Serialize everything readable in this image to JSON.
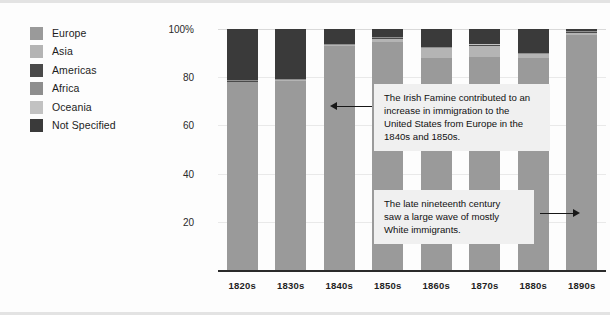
{
  "legend": {
    "items": [
      {
        "label": "Europe",
        "color": "#9a9a9a"
      },
      {
        "label": "Asia",
        "color": "#b4b4b4"
      },
      {
        "label": "Americas",
        "color": "#4a4a4a"
      },
      {
        "label": "Africa",
        "color": "#8e8e8e"
      },
      {
        "label": "Oceania",
        "color": "#c2c2c2"
      },
      {
        "label": "Not Specified",
        "color": "#3a3a3a"
      }
    ]
  },
  "axes": {
    "y_ticks": [
      "100%",
      "80",
      "60",
      "40",
      "20"
    ],
    "y_tick_values": [
      100,
      80,
      60,
      40,
      20
    ]
  },
  "annotations": [
    {
      "name": "irish-famine-note",
      "lines": [
        "The Irish Famine contributed to an",
        "increase in immigration to the",
        "United States from Europe in the",
        "1840s and 1850s."
      ],
      "arrow_direction": "left"
    },
    {
      "name": "late-nineteenth-century-note",
      "lines": [
        "The late nineteenth century",
        "saw a large wave of mostly",
        "White immigrants."
      ],
      "arrow_direction": "right"
    }
  ],
  "chart_data": {
    "type": "bar",
    "subtype": "stacked-100-percent",
    "title": "",
    "xlabel": "",
    "ylabel": "",
    "ylim": [
      0,
      100
    ],
    "grid": true,
    "legend_position": "left",
    "categories": [
      "1820s",
      "1830s",
      "1840s",
      "1850s",
      "1860s",
      "1870s",
      "1880s",
      "1890s"
    ],
    "series": [
      {
        "name": "Europe",
        "color": "#9a9a9a",
        "values": [
          78.0,
          78.5,
          93.0,
          94.5,
          88.0,
          88.5,
          88.0,
          97.5
        ]
      },
      {
        "name": "Asia",
        "color": "#b4b4b4",
        "values": [
          0.2,
          0.2,
          0.2,
          1.5,
          4.0,
          4.5,
          1.5,
          1.0
        ]
      },
      {
        "name": "Americas",
        "color": "#4a4a4a",
        "values": [
          0.3,
          0.3,
          0.3,
          0.3,
          0.3,
          0.3,
          0.3,
          0.3
        ]
      },
      {
        "name": "Africa",
        "color": "#8e8e8e",
        "values": [
          0.2,
          0.2,
          0.2,
          0.2,
          0.2,
          0.2,
          0.2,
          0.2
        ]
      },
      {
        "name": "Oceania",
        "color": "#c2c2c2",
        "values": [
          0.1,
          0.1,
          0.1,
          0.1,
          0.1,
          0.1,
          0.1,
          0.1
        ]
      },
      {
        "name": "Not Specified",
        "color": "#3a3a3a",
        "values": [
          21.2,
          20.7,
          6.2,
          3.4,
          7.4,
          6.4,
          9.9,
          0.9
        ]
      }
    ]
  }
}
